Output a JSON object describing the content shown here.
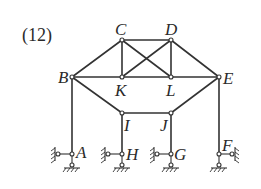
{
  "figure": {
    "number_label": "(12)",
    "type": "truss-frame structure with supports",
    "colors": {
      "line": "#333333",
      "background": "#ffffff"
    }
  },
  "nodes": {
    "A": {
      "label": "A",
      "x": 72,
      "y": 154
    },
    "B": {
      "label": "B",
      "x": 72,
      "y": 77
    },
    "C": {
      "label": "C",
      "x": 122,
      "y": 40
    },
    "D": {
      "label": "D",
      "x": 171,
      "y": 40
    },
    "E": {
      "label": "E",
      "x": 219,
      "y": 77
    },
    "F": {
      "label": "F",
      "x": 219,
      "y": 154
    },
    "G": {
      "label": "G",
      "x": 171,
      "y": 154
    },
    "H": {
      "label": "H",
      "x": 122,
      "y": 154
    },
    "I": {
      "label": "I",
      "x": 122,
      "y": 113
    },
    "J": {
      "label": "J",
      "x": 171,
      "y": 113
    },
    "K": {
      "label": "K",
      "x": 122,
      "y": 77
    },
    "L": {
      "label": "L",
      "x": 171,
      "y": 77
    }
  },
  "members": [
    [
      "B",
      "C"
    ],
    [
      "C",
      "D"
    ],
    [
      "D",
      "E"
    ],
    [
      "B",
      "E"
    ],
    [
      "C",
      "K"
    ],
    [
      "D",
      "L"
    ],
    [
      "C",
      "L"
    ],
    [
      "D",
      "K"
    ],
    [
      "B",
      "I"
    ],
    [
      "I",
      "J"
    ],
    [
      "J",
      "E"
    ],
    [
      "B",
      "A"
    ],
    [
      "I",
      "H"
    ],
    [
      "J",
      "G"
    ],
    [
      "E",
      "F"
    ]
  ],
  "supports": [
    {
      "node": "A",
      "side_link": "left"
    },
    {
      "node": "H",
      "side_link": "left"
    },
    {
      "node": "G",
      "side_link": "left"
    },
    {
      "node": "F",
      "side_link": "right"
    }
  ]
}
